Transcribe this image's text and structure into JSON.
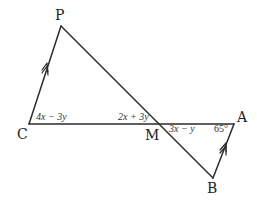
{
  "diagram": {
    "points": {
      "P": {
        "label": "P",
        "x": 61,
        "y": 26
      },
      "C": {
        "label": "C",
        "x": 29,
        "y": 124
      },
      "M": {
        "label": "M",
        "x": 160,
        "y": 124
      },
      "A": {
        "label": "A",
        "x": 234,
        "y": 124
      },
      "B": {
        "label": "B",
        "x": 213,
        "y": 178
      }
    },
    "segments": [
      {
        "from": "P",
        "to": "C"
      },
      {
        "from": "C",
        "to": "A"
      },
      {
        "from": "P",
        "to": "B"
      },
      {
        "from": "B",
        "to": "A"
      }
    ],
    "parallel_marks": [
      {
        "segment": "PC",
        "direction": "C-to-P"
      },
      {
        "segment": "BA",
        "direction": "B-to-A"
      }
    ],
    "angle_labels": {
      "angle_C": "4x − 3y",
      "angle_PMC": "2x + 3y",
      "angle_AMB": "3x − y",
      "angle_A": "65°"
    }
  }
}
